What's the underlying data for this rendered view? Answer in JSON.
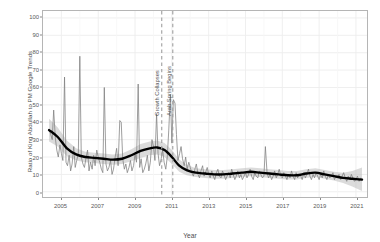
{
  "chart_data": {
    "type": "line",
    "title": "",
    "xlabel": "Year",
    "ylabel": "Ratio of King Abdullah to PM Google Trends",
    "xlim": [
      2004.0,
      2021.6
    ],
    "ylim": [
      -3,
      104
    ],
    "xticks": [
      2005,
      2007,
      2009,
      2011,
      2013,
      2015,
      2017,
      2019,
      2021
    ],
    "yticks": [
      0,
      10,
      20,
      30,
      40,
      50,
      60,
      70,
      80,
      90,
      100
    ],
    "grid": true,
    "legend": "none",
    "colors": {
      "raw_series": "#7f7f7f",
      "trend_line": "#000000",
      "confidence_band": "#bdbdbd",
      "event_line": "#9e9e9e",
      "panel_border": "#b5b5b5",
      "gridline": "#ededed",
      "background": "#ffffff"
    },
    "annotations": [
      {
        "label": "Growth Collapses",
        "x": 2010.45
      },
      {
        "label": "Arab Spring Begins",
        "x": 2011.05
      }
    ],
    "series": [
      {
        "name": "Monthly ratio (raw)",
        "style": "noisy-line",
        "x": [
          2004.33,
          2004.42,
          2004.5,
          2004.58,
          2004.67,
          2004.75,
          2004.83,
          2004.92,
          2005.0,
          2005.08,
          2005.17,
          2005.25,
          2005.33,
          2005.42,
          2005.5,
          2005.58,
          2005.67,
          2005.75,
          2005.83,
          2005.92,
          2006.0,
          2006.08,
          2006.17,
          2006.25,
          2006.33,
          2006.42,
          2006.5,
          2006.58,
          2006.67,
          2006.75,
          2006.83,
          2006.92,
          2007.0,
          2007.08,
          2007.17,
          2007.25,
          2007.33,
          2007.42,
          2007.5,
          2007.58,
          2007.67,
          2007.75,
          2007.83,
          2007.92,
          2008.0,
          2008.08,
          2008.17,
          2008.25,
          2008.33,
          2008.42,
          2008.5,
          2008.58,
          2008.67,
          2008.75,
          2008.83,
          2008.92,
          2009.0,
          2009.08,
          2009.17,
          2009.25,
          2009.33,
          2009.42,
          2009.5,
          2009.58,
          2009.67,
          2009.75,
          2009.83,
          2009.92,
          2010.0,
          2010.08,
          2010.17,
          2010.25,
          2010.33,
          2010.42,
          2010.5,
          2010.58,
          2010.67,
          2010.75,
          2010.83,
          2010.92,
          2011.0,
          2011.08,
          2011.17,
          2011.25,
          2011.33,
          2011.42,
          2011.5,
          2011.58,
          2011.67,
          2011.75,
          2011.83,
          2011.92,
          2012.0,
          2012.08,
          2012.17,
          2012.25,
          2012.33,
          2012.42,
          2012.5,
          2012.58,
          2012.67,
          2012.75,
          2012.83,
          2012.92,
          2013.0,
          2013.08,
          2013.17,
          2013.25,
          2013.33,
          2013.42,
          2013.5,
          2013.58,
          2013.67,
          2013.75,
          2013.83,
          2013.92,
          2014.0,
          2014.08,
          2014.17,
          2014.25,
          2014.33,
          2014.42,
          2014.5,
          2014.58,
          2014.67,
          2014.75,
          2014.83,
          2014.92,
          2015.0,
          2015.08,
          2015.17,
          2015.25,
          2015.33,
          2015.42,
          2015.5,
          2015.58,
          2015.67,
          2015.75,
          2015.83,
          2015.92,
          2016.0,
          2016.08,
          2016.17,
          2016.25,
          2016.33,
          2016.42,
          2016.5,
          2016.58,
          2016.67,
          2016.75,
          2016.83,
          2016.92,
          2017.0,
          2017.08,
          2017.17,
          2017.25,
          2017.33,
          2017.42,
          2017.5,
          2017.58,
          2017.67,
          2017.75,
          2017.83,
          2017.92,
          2018.0,
          2018.08,
          2018.17,
          2018.25,
          2018.33,
          2018.42,
          2018.5,
          2018.58,
          2018.67,
          2018.75,
          2018.83,
          2018.92,
          2019.0,
          2019.08,
          2019.17,
          2019.25,
          2019.33,
          2019.42,
          2019.5,
          2019.58,
          2019.67,
          2019.75,
          2019.83,
          2019.92,
          2020.0,
          2020.08,
          2020.17,
          2020.25,
          2020.33,
          2020.42,
          2020.5,
          2020.58,
          2020.67,
          2020.75,
          2020.83,
          2020.92,
          2021.0,
          2021.08,
          2021.17,
          2021.25,
          2021.33
        ],
        "values": [
          36,
          33,
          30,
          47,
          31,
          24,
          20,
          27,
          22,
          18,
          66,
          17,
          15,
          21,
          12,
          16,
          26,
          14,
          18,
          22,
          78,
          20,
          16,
          14,
          19,
          24,
          12,
          17,
          13,
          21,
          15,
          24,
          20,
          17,
          13,
          11,
          60,
          16,
          12,
          14,
          18,
          10,
          13,
          20,
          25,
          15,
          41,
          40,
          19,
          13,
          16,
          11,
          14,
          18,
          12,
          15,
          22,
          17,
          62,
          14,
          19,
          11,
          13,
          16,
          21,
          12,
          17,
          30,
          26,
          18,
          45,
          22,
          15,
          19,
          24,
          17,
          13,
          20,
          35,
          56,
          28,
          53,
          51,
          33,
          18,
          22,
          26,
          19,
          15,
          20,
          13,
          17,
          14,
          11,
          9,
          13,
          16,
          10,
          8,
          12,
          15,
          9,
          11,
          14,
          10,
          8,
          12,
          9,
          7,
          11,
          13,
          9,
          8,
          12,
          10,
          7,
          9,
          11,
          8,
          13,
          10,
          7,
          9,
          12,
          8,
          10,
          7,
          9,
          11,
          8,
          10,
          13,
          9,
          7,
          11,
          9,
          8,
          12,
          10,
          8,
          9,
          26,
          11,
          8,
          10,
          7,
          9,
          12,
          8,
          10,
          13,
          9,
          8,
          11,
          9,
          7,
          10,
          8,
          12,
          9,
          7,
          11,
          8,
          10,
          9,
          7,
          11,
          8,
          10,
          13,
          9,
          7,
          10,
          8,
          11,
          9,
          7,
          10,
          8,
          12,
          9,
          7,
          10,
          8,
          9,
          11,
          7,
          9,
          8,
          10,
          7,
          9,
          11,
          8,
          6,
          9,
          7,
          10,
          8,
          6,
          7,
          9,
          6,
          8,
          7
        ]
      },
      {
        "name": "Smoothed trend (loess)",
        "style": "thick-line",
        "x": [
          2004.33,
          2004.8,
          2005.3,
          2005.8,
          2006.3,
          2006.8,
          2007.3,
          2007.8,
          2008.3,
          2008.8,
          2009.3,
          2009.8,
          2010.2,
          2010.6,
          2011.0,
          2011.4,
          2011.8,
          2012.3,
          2012.8,
          2013.3,
          2013.8,
          2014.3,
          2014.8,
          2015.3,
          2015.8,
          2016.3,
          2016.8,
          2017.3,
          2017.8,
          2018.3,
          2018.8,
          2019.3,
          2019.8,
          2020.3,
          2020.8,
          2021.33
        ],
        "values": [
          35.5,
          31.5,
          25.0,
          21.5,
          20.0,
          19.5,
          19.0,
          18.5,
          19.0,
          21.0,
          23.5,
          25.0,
          25.5,
          24.0,
          20.0,
          15.0,
          12.5,
          11.0,
          10.5,
          10.0,
          10.0,
          10.5,
          11.0,
          11.5,
          11.0,
          10.5,
          10.0,
          9.5,
          9.5,
          10.5,
          11.0,
          10.0,
          9.0,
          8.0,
          7.5,
          7.0
        ]
      },
      {
        "name": "Confidence band (upper)",
        "style": "band",
        "x": [
          2004.33,
          2004.8,
          2005.3,
          2005.8,
          2006.3,
          2006.8,
          2007.3,
          2007.8,
          2008.3,
          2008.8,
          2009.3,
          2009.8,
          2010.2,
          2010.6,
          2011.0,
          2011.4,
          2011.8,
          2012.3,
          2012.8,
          2013.3,
          2013.8,
          2014.3,
          2014.8,
          2015.3,
          2015.8,
          2016.3,
          2016.8,
          2017.3,
          2017.8,
          2018.3,
          2018.8,
          2019.3,
          2019.8,
          2020.3,
          2020.8,
          2021.33
        ],
        "values": [
          42.0,
          37.0,
          29.5,
          25.0,
          23.0,
          22.5,
          22.0,
          21.5,
          22.0,
          24.5,
          27.5,
          29.0,
          29.5,
          28.0,
          24.0,
          18.5,
          15.5,
          13.5,
          13.0,
          12.5,
          12.5,
          13.0,
          13.5,
          14.0,
          13.5,
          13.0,
          12.5,
          12.0,
          12.0,
          13.0,
          13.5,
          12.5,
          11.5,
          11.0,
          12.0,
          14.0
        ]
      },
      {
        "name": "Confidence band (lower)",
        "style": "band",
        "x": [
          2004.33,
          2004.8,
          2005.3,
          2005.8,
          2006.3,
          2006.8,
          2007.3,
          2007.8,
          2008.3,
          2008.8,
          2009.3,
          2009.8,
          2010.2,
          2010.6,
          2011.0,
          2011.4,
          2011.8,
          2012.3,
          2012.8,
          2013.3,
          2013.8,
          2014.3,
          2014.8,
          2015.3,
          2015.8,
          2016.3,
          2016.8,
          2017.3,
          2017.8,
          2018.3,
          2018.8,
          2019.3,
          2019.8,
          2020.3,
          2020.8,
          2021.33
        ],
        "values": [
          29.0,
          26.0,
          20.5,
          18.0,
          17.0,
          16.5,
          16.0,
          15.5,
          16.0,
          17.5,
          19.5,
          21.0,
          21.5,
          20.0,
          16.0,
          11.5,
          9.5,
          8.5,
          8.0,
          7.5,
          7.5,
          8.0,
          8.5,
          9.0,
          8.5,
          8.0,
          7.5,
          7.0,
          7.0,
          8.0,
          8.5,
          7.5,
          6.5,
          5.0,
          3.0,
          0.5
        ]
      }
    ]
  }
}
